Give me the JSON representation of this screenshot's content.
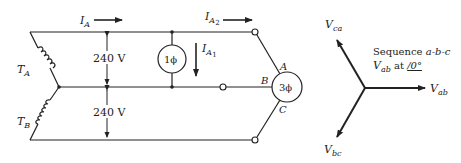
{
  "circuit": {
    "current_IA": {
      "main": "I",
      "sub": "A"
    },
    "current_IA2": {
      "main": "I",
      "sub": "A",
      "subsub": "2"
    },
    "current_IA1": {
      "main": "I",
      "sub": "A",
      "subsub": "1"
    },
    "transformer_TA": {
      "main": "T",
      "sub": "A"
    },
    "transformer_TB": {
      "main": "T",
      "sub": "B"
    },
    "voltage_top": "240 V",
    "voltage_bottom": "240 V",
    "single_phase_load": "1ϕ",
    "three_phase_load": "3ϕ",
    "terminal_A": "A",
    "terminal_B": "B",
    "terminal_C": "C"
  },
  "phasor": {
    "Vca": {
      "main": "V",
      "sub": "ca"
    },
    "Vab": {
      "main": "V",
      "sub": "ab"
    },
    "Vbc": {
      "main": "V",
      "sub": "bc"
    },
    "sequence_label": "Sequence ",
    "sequence_value": "a-b-c",
    "ref_main": "V",
    "ref_sub": "ab",
    "ref_at": " at ",
    "ref_angle": "/0°"
  },
  "colors": {
    "ink": "#222222",
    "background": "#ffffff"
  }
}
